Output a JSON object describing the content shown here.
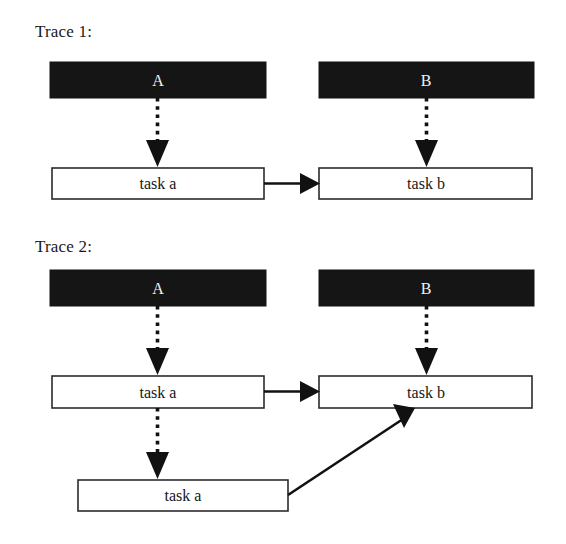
{
  "figure": {
    "background_color": "#ffffff",
    "bar_color": "#151515",
    "box_fill_color": "#ffffff",
    "box_stroke_color": "#2b2b2b",
    "line_color": "#111111",
    "bar_text_color": "#f2f2f2"
  },
  "traces": [
    {
      "id": "trace-1",
      "label": "Trace 1:",
      "bars": [
        {
          "id": "trace1-bar-a",
          "label": "A"
        },
        {
          "id": "trace1-bar-b",
          "label": "B"
        }
      ],
      "tasks": [
        {
          "id": "trace1-task-a",
          "label": "task a"
        },
        {
          "id": "trace1-task-b",
          "label": "task b"
        }
      ],
      "edges": [
        {
          "id": "trace1-edge-a-to-task-a",
          "style": "dotted",
          "from": "A",
          "to": "task a"
        },
        {
          "id": "trace1-edge-b-to-task-b",
          "style": "dotted",
          "from": "B",
          "to": "task b"
        },
        {
          "id": "trace1-edge-task-a-to-task-b",
          "style": "solid",
          "from": "task a",
          "to": "task b"
        }
      ]
    },
    {
      "id": "trace-2",
      "label": "Trace 2:",
      "bars": [
        {
          "id": "trace2-bar-a",
          "label": "A"
        },
        {
          "id": "trace2-bar-b",
          "label": "B"
        }
      ],
      "tasks": [
        {
          "id": "trace2-task-a-upper",
          "label": "task a"
        },
        {
          "id": "trace2-task-b",
          "label": "task b"
        },
        {
          "id": "trace2-task-a-lower",
          "label": "task a"
        }
      ],
      "edges": [
        {
          "id": "trace2-edge-a-to-task-a",
          "style": "dotted",
          "from": "A",
          "to": "task a"
        },
        {
          "id": "trace2-edge-b-to-task-b",
          "style": "dotted",
          "from": "B",
          "to": "task b"
        },
        {
          "id": "trace2-edge-task-a-to-task-b",
          "style": "solid",
          "from": "task a",
          "to": "task b"
        },
        {
          "id": "trace2-edge-task-a-to-task-a-lower",
          "style": "dotted",
          "from": "task a",
          "to": "task a"
        },
        {
          "id": "trace2-edge-task-a-lower-to-task-b",
          "style": "solid",
          "from": "task a",
          "to": "task b"
        }
      ]
    }
  ]
}
